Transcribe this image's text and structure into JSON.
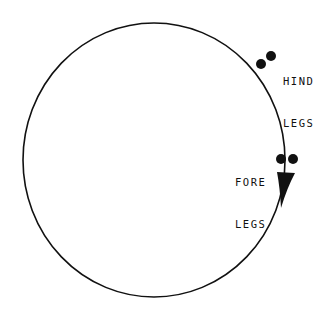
{
  "diagram": {
    "type": "gait-circle",
    "labels": {
      "hind_line1": "HIND",
      "hind_line2": "LEGS",
      "fore_line1": "FORE",
      "fore_line2": "LEGS"
    },
    "colors": {
      "stroke": "#111111",
      "background": "#ffffff"
    },
    "elements": {
      "circle": {
        "cx": 154,
        "cy": 160,
        "rx": 131,
        "ry": 137
      },
      "hind_dots": [
        {
          "cx": 261,
          "cy": 64
        },
        {
          "cx": 271,
          "cy": 56
        }
      ],
      "fore_dots": [
        {
          "cx": 281,
          "cy": 159
        },
        {
          "cx": 293,
          "cy": 159
        }
      ],
      "arrow": {
        "direction": "clockwise-down",
        "tip_x": 281,
        "tip_y": 205
      }
    }
  }
}
